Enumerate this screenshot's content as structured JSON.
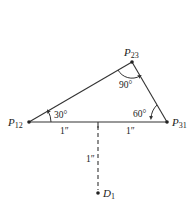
{
  "diagram": {
    "type": "triangle-geometry",
    "points": {
      "P12": {
        "label": "P",
        "sub": "12"
      },
      "P23": {
        "label": "P",
        "sub": "23"
      },
      "P31": {
        "label": "P",
        "sub": "31"
      },
      "D1": {
        "label": "D",
        "sub": "1"
      }
    },
    "angles": {
      "at_P12": "30°",
      "at_P23": "90°",
      "at_P31": "60°"
    },
    "dimensions": {
      "left_half": "1″",
      "right_half": "1″",
      "perpendicular": "1″"
    },
    "colors": {
      "line": "#333333",
      "text": "#222222",
      "background": "#ffffff"
    }
  }
}
